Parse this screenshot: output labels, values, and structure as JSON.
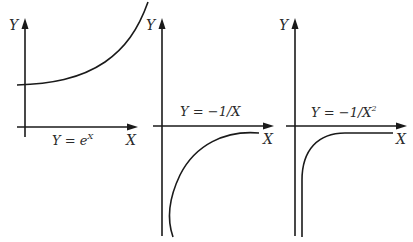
{
  "diagram": {
    "colors": {
      "ink": "#1a1a1a",
      "background": "#ffffff"
    },
    "panels": [
      {
        "id": "exp",
        "y_axis_label": "Y",
        "x_axis_label": "X",
        "equation_prefix": "Y  =  e",
        "equation_exponent": "X",
        "curve": "exponential growth, positive intercept, rising steeply to upper right"
      },
      {
        "id": "neg-reciprocal",
        "y_axis_label": "Y",
        "x_axis_label": "X",
        "equation_prefix": "Y  =  −1/X",
        "equation_exponent": "",
        "curve": "below X-axis, approaches 0 from below as X grows, plunges toward −∞ near X=0"
      },
      {
        "id": "neg-reciprocal-square",
        "y_axis_label": "Y",
        "x_axis_label": "X",
        "equation_prefix": "Y  =  −1/X",
        "equation_exponent": "2",
        "curve": "below X-axis, flattens quickly toward 0, sharp vertical drop near X=0"
      }
    ]
  }
}
